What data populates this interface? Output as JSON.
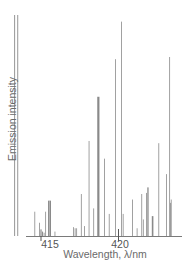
{
  "chart_data": {
    "type": "bar",
    "title": "",
    "xlabel": "Wavelength, λ/nm",
    "ylabel": "Emission intensity",
    "xlim": [
      413.2,
      423.4
    ],
    "ylim": [
      0,
      100
    ],
    "grid": false,
    "legend": null,
    "x_ticks": [
      415,
      420
    ],
    "tick_labels": [
      "415",
      "420"
    ],
    "line_color": "#8a8a8a",
    "axis_color": "#7a7a7a",
    "series": [
      {
        "name": "emission lines",
        "points": [
          {
            "x": 413.3,
            "y": 100,
            "w": 0.9
          },
          {
            "x": 413.5,
            "y": 100,
            "w": 0.9
          },
          {
            "x": 414.6,
            "y": 11,
            "w": 0.8
          },
          {
            "x": 414.9,
            "y": 6,
            "w": 0.8
          },
          {
            "x": 415.0,
            "y": 3,
            "w": 1.2
          },
          {
            "x": 415.1,
            "y": 2,
            "w": 1.0
          },
          {
            "x": 415.2,
            "y": 1.5,
            "w": 0.8
          },
          {
            "x": 415.3,
            "y": 11,
            "w": 0.8
          },
          {
            "x": 415.5,
            "y": 16,
            "w": 1.4
          },
          {
            "x": 415.6,
            "y": 16,
            "w": 1.4
          },
          {
            "x": 415.9,
            "y": 2,
            "w": 0.8
          },
          {
            "x": 417.1,
            "y": 4,
            "w": 0.8
          },
          {
            "x": 417.2,
            "y": 3.5,
            "w": 0.8
          },
          {
            "x": 417.3,
            "y": 3.5,
            "w": 0.8
          },
          {
            "x": 417.6,
            "y": 19,
            "w": 0.8
          },
          {
            "x": 417.8,
            "y": 4.5,
            "w": 0.8
          },
          {
            "x": 418.1,
            "y": 43,
            "w": 0.8
          },
          {
            "x": 418.4,
            "y": 12.5,
            "w": 0.8
          },
          {
            "x": 418.7,
            "y": 63,
            "w": 2.2
          },
          {
            "x": 419.1,
            "y": 35,
            "w": 0.8
          },
          {
            "x": 419.4,
            "y": 10,
            "w": 0.8
          },
          {
            "x": 419.8,
            "y": 80,
            "w": 0.8
          },
          {
            "x": 420.0,
            "y": 3,
            "w": 0.8
          },
          {
            "x": 420.2,
            "y": 97,
            "w": 0.8
          },
          {
            "x": 420.3,
            "y": 10,
            "w": 0.8
          },
          {
            "x": 420.9,
            "y": 16.5,
            "w": 0.8
          },
          {
            "x": 421.2,
            "y": 3.5,
            "w": 0.8
          },
          {
            "x": 421.5,
            "y": 19,
            "w": 0.8
          },
          {
            "x": 421.6,
            "y": 7.5,
            "w": 0.8
          },
          {
            "x": 421.8,
            "y": 19.5,
            "w": 0.8
          },
          {
            "x": 421.9,
            "y": 22,
            "w": 1.3
          },
          {
            "x": 422.2,
            "y": 9,
            "w": 1.6
          },
          {
            "x": 422.6,
            "y": 42,
            "w": 0.8
          },
          {
            "x": 423.1,
            "y": 28,
            "w": 0.8
          },
          {
            "x": 423.3,
            "y": 81,
            "w": 0.8
          },
          {
            "x": 423.35,
            "y": 15,
            "w": 0.8
          },
          {
            "x": 423.4,
            "y": 16.5,
            "w": 0.8
          }
        ]
      }
    ]
  },
  "labels": {
    "ylabel": "Emission intensity",
    "xlabel": "Wavelength, λ/nm",
    "tick415": "415",
    "tick420": "420"
  }
}
